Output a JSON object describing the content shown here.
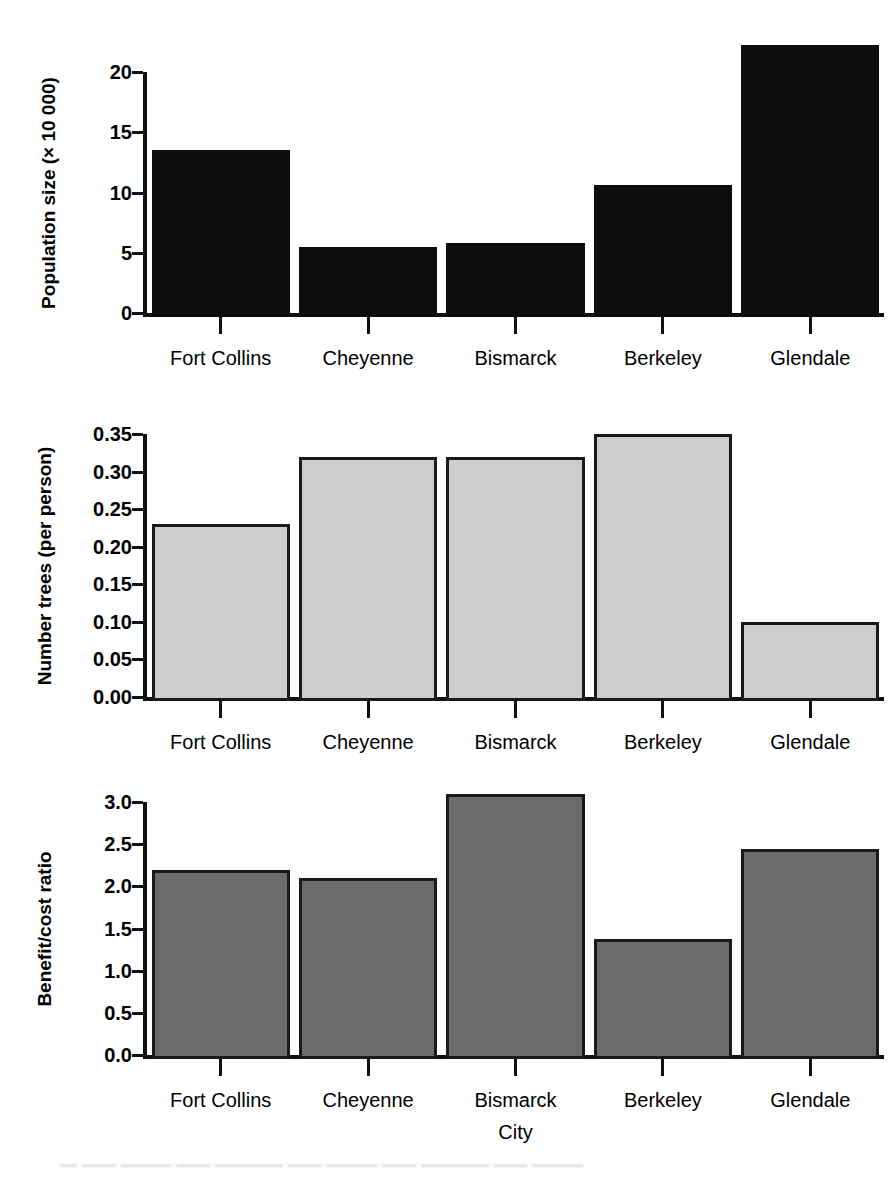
{
  "figure": {
    "background": "#ffffff",
    "axis_color": "#111111",
    "width": 892,
    "height": 1179
  },
  "chart_data": [
    {
      "id": "population",
      "type": "bar",
      "title": "",
      "xlabel": "",
      "ylabel": "Population size (× 10 000)",
      "categories": [
        "Fort Collins",
        "Cheyenne",
        "Bismarck",
        "Berkeley",
        "Glendale"
      ],
      "values": [
        13.5,
        5.5,
        5.8,
        10.6,
        22.2
      ],
      "ylim": [
        0,
        20
      ],
      "yticks": [
        0,
        5,
        10,
        15,
        20
      ],
      "ytick_labels": [
        "0",
        "5",
        "10",
        "15",
        "20"
      ],
      "grid": false,
      "legend": "none",
      "bar_fill": "#0d0d0d",
      "bar_stroke": "#0d0d0d"
    },
    {
      "id": "trees",
      "type": "bar",
      "title": "",
      "xlabel": "",
      "ylabel": "Number trees (per person)",
      "categories": [
        "Fort Collins",
        "Cheyenne",
        "Bismarck",
        "Berkeley",
        "Glendale"
      ],
      "values": [
        0.23,
        0.32,
        0.32,
        0.35,
        0.1
      ],
      "ylim": [
        0,
        0.35
      ],
      "yticks": [
        0.0,
        0.05,
        0.1,
        0.15,
        0.2,
        0.25,
        0.3,
        0.35
      ],
      "ytick_labels": [
        "0.00",
        "0.05",
        "0.10",
        "0.15",
        "0.20",
        "0.25",
        "0.30",
        "0.35"
      ],
      "grid": false,
      "legend": "none",
      "bar_fill": "#cdcdcd",
      "bar_stroke": "#1a1a1a"
    },
    {
      "id": "benefit-cost",
      "type": "bar",
      "title": "",
      "xlabel": "City",
      "ylabel": "Benefit/cost ratio",
      "categories": [
        "Fort Collins",
        "Cheyenne",
        "Bismarck",
        "Berkeley",
        "Glendale"
      ],
      "values": [
        2.19,
        2.1,
        3.1,
        1.38,
        2.44
      ],
      "ylim": [
        0,
        3.0
      ],
      "yticks": [
        0.0,
        0.5,
        1.0,
        1.5,
        2.0,
        2.5,
        3.0
      ],
      "ytick_labels": [
        "0.0",
        "0.5",
        "1.0",
        "1.5",
        "2.0",
        "2.5",
        "3.0"
      ],
      "grid": false,
      "legend": "none",
      "bar_fill": "#6b6b6b",
      "bar_stroke": "#1a1a1a"
    }
  ],
  "footer": {
    "scan_artifact": "— —— ——— —— ———— —— ——— —— ———— —— ———"
  }
}
